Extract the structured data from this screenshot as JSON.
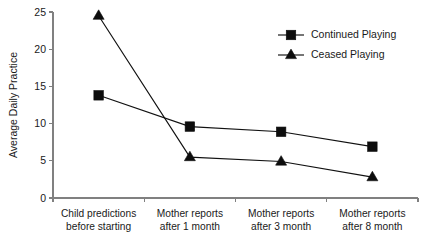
{
  "chart_data": {
    "type": "line",
    "title": "",
    "xlabel": "",
    "ylabel": "Average Daily Practice",
    "ylim": [
      0,
      25
    ],
    "yticks": [
      0,
      5,
      10,
      15,
      20,
      25
    ],
    "ytick_labels": [
      "0",
      "5",
      "10",
      "15",
      "20",
      "25"
    ],
    "grid": false,
    "legend_position": "top-right",
    "categories": [
      "Child predictions before starting",
      "Mother reports after 1 month",
      "Mother reports after 3 month",
      "Mother reports after 8 month"
    ],
    "category_lines": [
      [
        "Child predictions",
        "before starting"
      ],
      [
        "Mother reports",
        "after 1 month"
      ],
      [
        "Mother reports",
        "after 3 month"
      ],
      [
        "Mother reports",
        "after 8 month"
      ]
    ],
    "series": [
      {
        "name": "Continued Playing",
        "marker": "square",
        "color": "#0d0d0d",
        "values": [
          13.8,
          9.6,
          8.9,
          6.9
        ]
      },
      {
        "name": "Ceased Playing",
        "marker": "triangle",
        "color": "#0d0d0d",
        "values": [
          24.5,
          5.5,
          4.9,
          2.8
        ]
      }
    ]
  },
  "legend": {
    "items": [
      {
        "label": "Continued Playing",
        "marker": "square"
      },
      {
        "label": "Ceased Playing",
        "marker": "triangle"
      }
    ]
  }
}
